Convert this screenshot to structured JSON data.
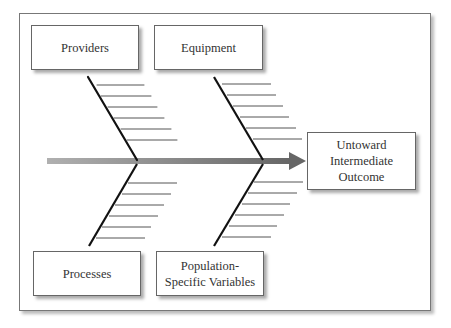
{
  "diagram": {
    "type": "fishbone",
    "causes": [
      {
        "label": "Providers",
        "position": "top-left"
      },
      {
        "label": "Equipment",
        "position": "top-right"
      },
      {
        "label": "Processes",
        "position": "bottom-left"
      },
      {
        "label": "Population-\nSpecific Variables",
        "position": "bottom-right"
      }
    ],
    "effect": {
      "label": "Untoward\nIntermediate\nOutcome"
    },
    "colors": {
      "spine": "#888888",
      "bones": "#111111",
      "ribs": "#555555",
      "box_border": "#666666"
    }
  }
}
